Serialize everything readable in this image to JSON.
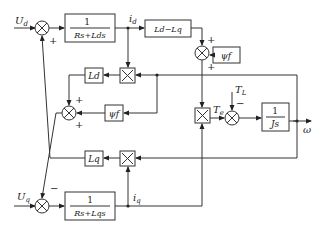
{
  "diagram": {
    "type": "block-diagram",
    "inputs": {
      "ud": "U",
      "ud_sub": "d",
      "uq": "U",
      "uq_sub": "q",
      "tl": "T",
      "tl_sub": "L"
    },
    "outputs": {
      "omega": "ω"
    },
    "signals": {
      "id": "i",
      "id_sub": "d",
      "iq": "i",
      "iq_sub": "q",
      "te": "T",
      "te_sub": "e"
    },
    "blocks": {
      "d_axis_num": "1",
      "d_axis_den": "Rs+Lds",
      "q_axis_num": "1",
      "q_axis_den": "Rs+Lqs",
      "ld_minus_lq": "Ld−Lq",
      "psi_f_top": "ψf",
      "psi_f_mid": "ψf",
      "ld": "Ld",
      "lq": "Lq",
      "mech_num": "1",
      "mech_den": "Js"
    },
    "signs": {
      "sum_d_bottom": "+",
      "sum_top_right_top": "+",
      "sum_top_right_bottom": "+",
      "sum_mid_top": "+",
      "sum_mid_bottom": "+",
      "sum_q_top": "−",
      "sum_torque_top": "−"
    }
  }
}
